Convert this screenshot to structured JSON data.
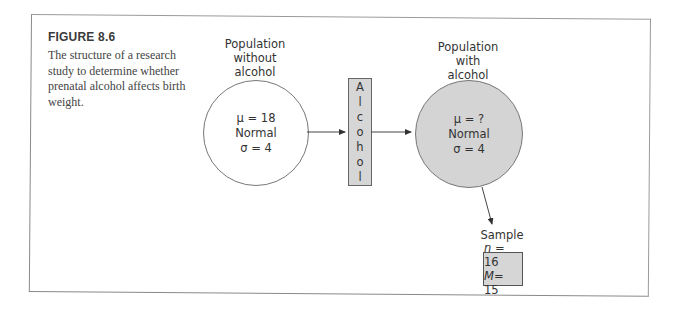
{
  "figure": {
    "title": "FIGURE 8.6",
    "caption": "The structure of a research study to determine whether prenatal alcohol affects birth weight."
  },
  "population_without": {
    "label_lines": [
      "Population",
      "without",
      "alcohol"
    ],
    "mu": "μ = 18",
    "shape": "Normal",
    "sigma": "σ = 4"
  },
  "treatment": {
    "letters": [
      "A",
      "l",
      "c",
      "o",
      "h",
      "o",
      "l"
    ]
  },
  "population_with": {
    "label_lines": [
      "Population",
      "with",
      "alcohol"
    ],
    "mu": "μ = ?",
    "shape": "Normal",
    "sigma": "σ = 4"
  },
  "sample": {
    "label": "Sample",
    "n_var": "n",
    "n_val": " = 16",
    "m_var": "M",
    "m_val": "= 15"
  },
  "colors": {
    "shaded_fill": "#d4d4d4",
    "box_fill": "#d6d6d6",
    "stroke": "#555555"
  }
}
